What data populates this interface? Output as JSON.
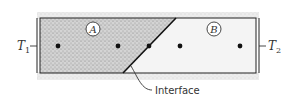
{
  "diagram": {
    "left_temperature": {
      "symbol": "T",
      "subscript": "1"
    },
    "right_temperature": {
      "symbol": "T",
      "subscript": "2"
    },
    "region_a_label": "A",
    "region_b_label": "B",
    "interface_label": "Interface",
    "nodes_count": 5,
    "colors": {
      "stipple": "#9a9a9a",
      "line": "#222222",
      "region_b_fill": "#f2f2f2",
      "region_a_fill": "#cfcfcf"
    }
  }
}
